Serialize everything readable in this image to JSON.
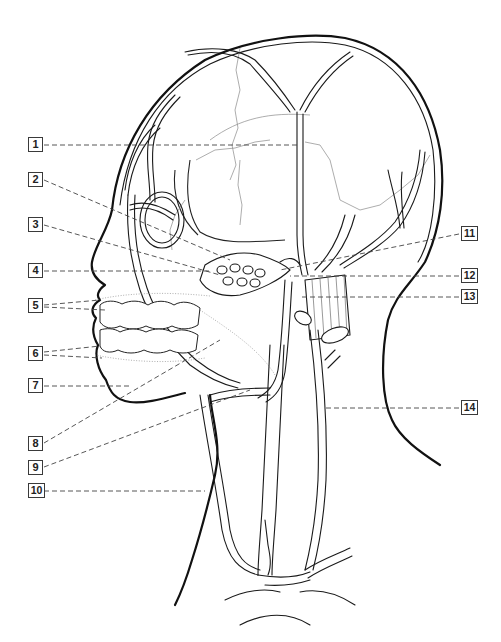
{
  "figure": {
    "style": "black line drawing on white background",
    "colors": {
      "background": "#ffffff",
      "line": "#1a1a1a",
      "leader": "#444444",
      "suture": "#8a8a8a"
    }
  },
  "labels": [
    {
      "id": 1,
      "text": "1",
      "side": "left",
      "x": 28,
      "y": 137
    },
    {
      "id": 2,
      "text": "2",
      "side": "left",
      "x": 28,
      "y": 172
    },
    {
      "id": 3,
      "text": "3",
      "side": "left",
      "x": 28,
      "y": 217
    },
    {
      "id": 4,
      "text": "4",
      "side": "left",
      "x": 28,
      "y": 263
    },
    {
      "id": 5,
      "text": "5",
      "side": "left",
      "x": 28,
      "y": 298
    },
    {
      "id": 6,
      "text": "6",
      "side": "left",
      "x": 28,
      "y": 346
    },
    {
      "id": 7,
      "text": "7",
      "side": "left",
      "x": 28,
      "y": 378
    },
    {
      "id": 8,
      "text": "8",
      "side": "left",
      "x": 28,
      "y": 436
    },
    {
      "id": 9,
      "text": "9",
      "side": "left",
      "x": 28,
      "y": 460
    },
    {
      "id": 10,
      "text": "10",
      "side": "left",
      "x": 28,
      "y": 483
    },
    {
      "id": 11,
      "text": "11",
      "side": "right",
      "x": 461,
      "y": 226
    },
    {
      "id": 12,
      "text": "12",
      "side": "right",
      "x": 461,
      "y": 268
    },
    {
      "id": 13,
      "text": "13",
      "side": "right",
      "x": 461,
      "y": 289
    },
    {
      "id": 14,
      "text": "14",
      "side": "right",
      "x": 461,
      "y": 400
    }
  ]
}
